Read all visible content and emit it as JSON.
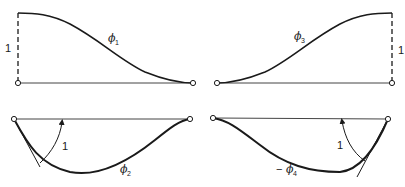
{
  "figure": {
    "panels": [
      {
        "id": "phi1",
        "symbol": "ϕ",
        "subscript": "1",
        "prefix": "",
        "magnitude_label": "1",
        "type": "displacement"
      },
      {
        "id": "phi3",
        "symbol": "ϕ",
        "subscript": "3",
        "prefix": "",
        "magnitude_label": "1",
        "type": "displacement"
      },
      {
        "id": "phi2",
        "symbol": "ϕ",
        "subscript": "2",
        "prefix": "",
        "magnitude_label": "1",
        "type": "rotation"
      },
      {
        "id": "phi4",
        "symbol": "ϕ",
        "subscript": "4",
        "prefix": "−",
        "magnitude_label": "1",
        "type": "rotation"
      }
    ],
    "colors": {
      "ink": "#1a1a1a",
      "background": "#ffffff"
    }
  }
}
